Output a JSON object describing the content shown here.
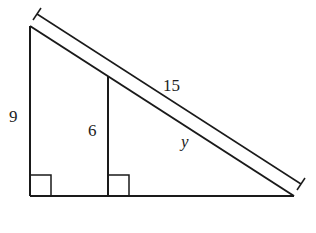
{
  "diagram": {
    "type": "similar right triangles",
    "labels": {
      "outer_height": "9",
      "inner_height": "6",
      "hypotenuse": "15",
      "inner_hypotenuse": "y"
    },
    "colors": {
      "stroke": "#1a1a1a",
      "background": "#ffffff"
    }
  }
}
